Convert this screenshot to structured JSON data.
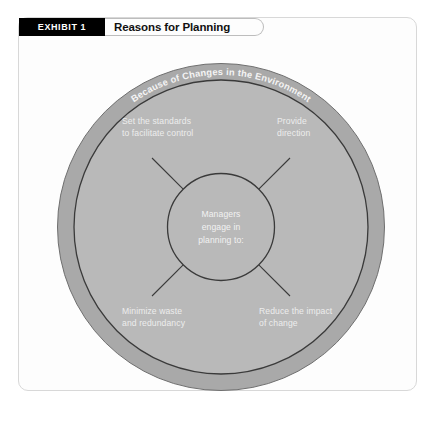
{
  "exhibit": {
    "badge": "EXHIBIT 1",
    "title": "Reasons for Planning"
  },
  "diagram": {
    "type": "concentric-circle-radial",
    "outer_ring_label": "Because of Changes in the Environment",
    "center": {
      "line1": "Managers",
      "line2": "engage in",
      "line3": "planning to:"
    },
    "quadrants": [
      {
        "position": "top-left",
        "line1": "Set the standards",
        "line2": "to facilitate control"
      },
      {
        "position": "top-right",
        "line1": "Provide",
        "line2": "direction"
      },
      {
        "position": "bottom-left",
        "line1": "Minimize waste",
        "line2": "and redundancy"
      },
      {
        "position": "bottom-right",
        "line1": "Reduce the impact",
        "line2": "of change"
      }
    ]
  },
  "colors": {
    "outer_ring": "#a9a9a9",
    "inner_disc": "#b9b9b9",
    "center_circle": "#b9b9b9",
    "outline": "#3a3a3a",
    "badge_bg": "#000000",
    "card_bg": "#fdfdfd"
  }
}
